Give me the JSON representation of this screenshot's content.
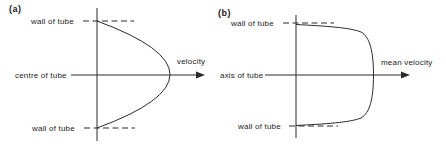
{
  "figure": {
    "panel_a": {
      "tag": "(a)",
      "wall_top_label": "wall of tube",
      "centerline_label": "centre of tube",
      "wall_bottom_label": "wall of tube",
      "arrow_label": "velocity",
      "profile": "parabolic (laminar)"
    },
    "panel_b": {
      "tag": "(b)",
      "wall_top_label": "wall of tube",
      "centerline_label": "axis of tube",
      "wall_bottom_label": "wall of tube",
      "arrow_label": "mean velocity",
      "profile": "flattened (turbulent)"
    },
    "colors": {
      "line": "#2b2b2b",
      "background": "#ffffff"
    }
  }
}
